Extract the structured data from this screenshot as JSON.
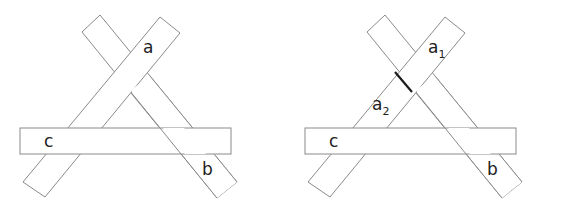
{
  "diagrams": [
    {
      "name": "left",
      "labels": {
        "a": "a",
        "b": "b",
        "c": "c"
      }
    },
    {
      "name": "right",
      "labels": {
        "a1": "a",
        "a1_sub": "1",
        "a2": "a",
        "a2_sub": "2",
        "b": "b",
        "c": "c"
      }
    }
  ],
  "colors": {
    "stroke": "#8a8a8a",
    "text": "#222222",
    "cut": "#1a1a1a",
    "background": "#ffffff"
  }
}
